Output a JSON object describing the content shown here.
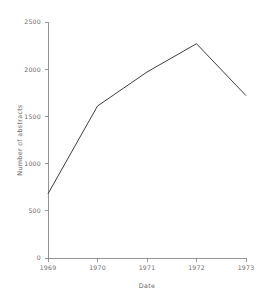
{
  "chart_data": {
    "type": "line",
    "title": "",
    "xlabel": "Date",
    "ylabel": "Number of abstracts",
    "categories": [
      "1969",
      "1970",
      "1971",
      "1972",
      "1973"
    ],
    "x": [
      1969,
      1970,
      1971,
      1972,
      1973
    ],
    "values": [
      680,
      1610,
      1970,
      2270,
      1720
    ],
    "series": [
      {
        "name": "Number of abstracts",
        "values": [
          680,
          1610,
          1970,
          2270,
          1720
        ]
      }
    ],
    "xlim": [
      1969,
      1973
    ],
    "ylim": [
      0,
      2500
    ],
    "x_tick_labels": [
      "1969",
      "1970",
      "1971",
      "1972",
      "1973"
    ],
    "y_tick_labels": [
      "0",
      "500",
      "1000",
      "1500",
      "2000",
      "2500"
    ],
    "y_ticks": [
      0,
      500,
      1000,
      1500,
      2000,
      2500
    ],
    "grid": false,
    "legend": false,
    "legend_position": "none",
    "line_color": "#3c3c3c",
    "text_color": "#6b6b6b",
    "axis_color": "#7a7a7a",
    "background_color": "#ffffff",
    "markers": false
  }
}
